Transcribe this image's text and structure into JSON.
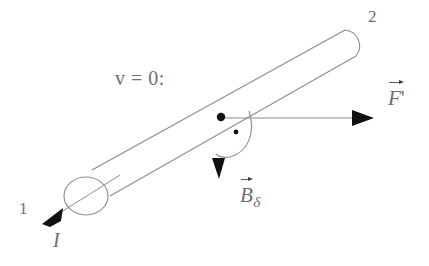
{
  "figure": {
    "background_color": "#ffffff",
    "line_color": "#8c8c8c",
    "ink_color": "#5a5a5a",
    "arrow_fill": "#111111",
    "labels": {
      "end_1": "1",
      "end_2": "2",
      "velocity_condition": "v = 0:",
      "current": "I",
      "force_symbol": "F",
      "force_prime": "'",
      "field_symbol": "B",
      "field_subscript": "δ"
    },
    "elements": {
      "rod": "rod-outline",
      "rod_axis": "rod-axis-line",
      "left_cap": "rod-left-end-circle",
      "right_cap": "rod-right-end-round",
      "field_point_large": "field-dot-large",
      "field_point_small": "field-dot-small",
      "angle_arc": "angle-arc",
      "force_arrow": "force-arrow",
      "field_arrow": "field-arrow",
      "current_arrow": "current-arrow"
    }
  }
}
